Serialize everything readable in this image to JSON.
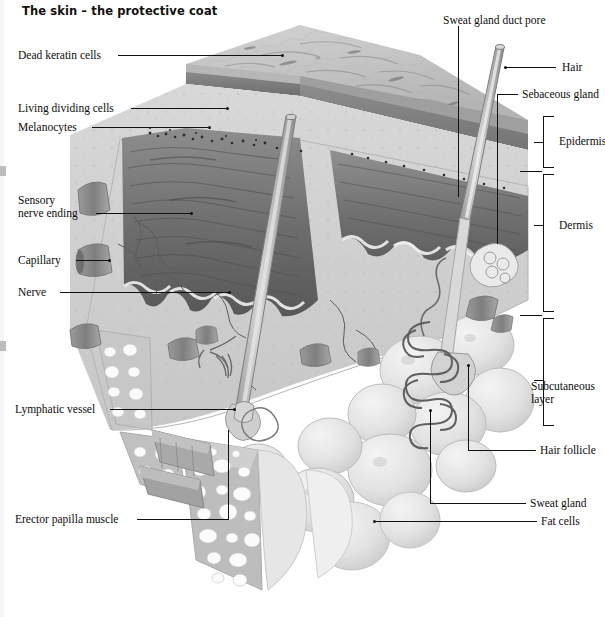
{
  "figure": {
    "title": "The skin – the protective coat",
    "style": "grayscale anatomical illustration, 3D block cutaway",
    "width": 605,
    "height": 617
  },
  "colors": {
    "background": "#ffffff",
    "ink": "#111111",
    "epidermis_surface": "#c3c3c3",
    "epidermis_cut": "#9a9a9a",
    "keratin_band": "#7d7d7d",
    "dermis_papillae_dark": "#6f6f6f",
    "dermis_matrix": "#d3d3d3",
    "subcutaneous_fat": "#e8e8e8",
    "vessel": "#8e8e8e"
  },
  "labels_left": [
    {
      "id": "dead-keratin-cells",
      "text": "Dead keratin cells",
      "x": 18,
      "y": 49,
      "line_from": 118,
      "line_to": 283,
      "line_y": 55,
      "marker": "arrow"
    },
    {
      "id": "living-dividing-cells",
      "text": "Living dividing cells",
      "x": 18,
      "y": 102,
      "line_from": 131,
      "line_to": 228,
      "line_y": 108,
      "marker": "arrow"
    },
    {
      "id": "melanocytes",
      "text": "Melanocytes",
      "x": 18,
      "y": 121,
      "line_from": 92,
      "line_to": 210,
      "line_y": 127,
      "marker": "arrow"
    },
    {
      "id": "sensory-nerve-ending",
      "text": "Sensory\nnerve ending",
      "x": 18,
      "y": 194,
      "line_from": 96,
      "line_to": 192,
      "line_y": 213,
      "marker": "dot"
    },
    {
      "id": "capillary",
      "text": "Capillary",
      "x": 18,
      "y": 254,
      "line_from": 76,
      "line_to": 110,
      "line_y": 260,
      "marker": "arrow"
    },
    {
      "id": "nerve",
      "text": "Nerve",
      "x": 18,
      "y": 286,
      "line_from": 60,
      "line_to": 230,
      "line_y": 292,
      "marker": "dot"
    },
    {
      "id": "lymphatic-vessel",
      "text": "Lymphatic vessel",
      "x": 15,
      "y": 403,
      "line_from": 110,
      "line_to": 235,
      "line_y": 409,
      "marker": "dot"
    },
    {
      "id": "erector-papilla-muscle",
      "text": "Erector papilla muscle",
      "x": 15,
      "y": 513,
      "line_from": 137,
      "line_to": 228,
      "line_y": 519,
      "marker": "arrow"
    }
  ],
  "labels_right": [
    {
      "id": "sweat-gland-duct-pore",
      "text": "Sweat gland duct pore",
      "x": 443,
      "y": 14,
      "kind": "vertical",
      "vx": 458,
      "vy_from": 26,
      "vy_to": 197
    },
    {
      "id": "hair",
      "text": "Hair",
      "x": 562,
      "y": 61,
      "kind": "horizontal",
      "line_from": 506,
      "line_to": 556,
      "line_y": 67
    },
    {
      "id": "sebaceous-gland",
      "text": "Sebaceous gland",
      "x": 522,
      "y": 88,
      "kind": "horizontal",
      "line_from": 497,
      "line_to": 518,
      "line_y": 94
    },
    {
      "id": "hair-follicle",
      "text": "Hair follicle",
      "x": 540,
      "y": 444,
      "kind": "elbow",
      "ex": 468,
      "ey_from": 365,
      "ey_to": 450,
      "line_from": 468,
      "line_to": 536,
      "line_y": 450
    },
    {
      "id": "sweat-gland",
      "text": "Sweat gland",
      "x": 530,
      "y": 497,
      "kind": "elbow",
      "ex": 430,
      "ey_from": 410,
      "ey_to": 503,
      "line_from": 430,
      "line_to": 526,
      "line_y": 503
    },
    {
      "id": "fat-cells",
      "text": "Fat cells",
      "x": 541,
      "y": 515,
      "kind": "horizontal",
      "line_from": 375,
      "line_to": 537,
      "line_y": 521
    }
  ],
  "brackets": [
    {
      "id": "epidermis",
      "text": "Epidermis",
      "x": 543,
      "label_x": 559,
      "label_y": 135,
      "top": 116,
      "bottom": 168,
      "tick_y": 142
    },
    {
      "id": "dermis",
      "text": "Dermis",
      "x": 543,
      "label_x": 559,
      "label_y": 219,
      "top": 174,
      "bottom": 312,
      "tick_y": 225
    },
    {
      "id": "subcutaneous-layer",
      "text": "Subcutaneous\nlayer",
      "x": 543,
      "label_x": 531,
      "label_y": 380,
      "top": 318,
      "bottom": 426,
      "tick_y": 393
    }
  ],
  "bracket_separators": [
    {
      "id": "sep-epidermis-dermis",
      "x": 536,
      "y": 171
    },
    {
      "id": "sep-dermis-subcut",
      "x": 536,
      "y": 315
    }
  ],
  "structures": [
    {
      "id": "epidermis-top-surface",
      "name": "skin surface slab"
    },
    {
      "id": "keratin-layer-band",
      "name": "dead keratin cell band"
    },
    {
      "id": "dermal-papillae",
      "name": "dark wavy dermal papillae ridges"
    },
    {
      "id": "hair-shaft-left",
      "name": "hair shaft emerging left of centre"
    },
    {
      "id": "hair-shaft-right",
      "name": "hair shaft emerging right"
    },
    {
      "id": "sweat-duct",
      "name": "sweat gland duct spiralling to pore"
    },
    {
      "id": "sweat-gland-coil",
      "name": "coiled sweat gland in subcutaneous layer"
    },
    {
      "id": "fat-lobules",
      "name": "rounded fat cell lobules"
    },
    {
      "id": "fat-cell-cross-section",
      "name": "fat cells cut face with white vacuoles"
    },
    {
      "id": "capillary-loops",
      "name": "capillary vessels in dermis"
    },
    {
      "id": "nerve-fibres",
      "name": "branching nerve fibres"
    },
    {
      "id": "lymphatic-vessel-tube",
      "name": "lymphatic vessel tube"
    },
    {
      "id": "erector-muscle-band",
      "name": "erector papilla muscle band"
    }
  ]
}
